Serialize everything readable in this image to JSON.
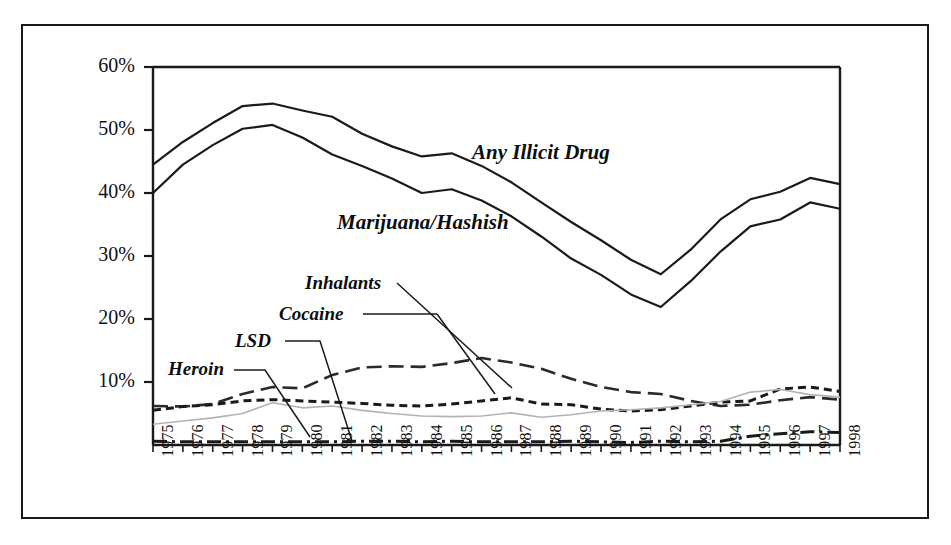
{
  "chart_data": {
    "type": "line",
    "title": "",
    "xlabel": "",
    "ylabel": "",
    "ylim": [
      0,
      60
    ],
    "xlim": [
      1975,
      1998
    ],
    "grid": false,
    "legend_position": "inline-annotations",
    "y_tick_labels": [
      "60%",
      "50%",
      "40%",
      "30%",
      "20%",
      "10%"
    ],
    "y_ticks": [
      60,
      50,
      40,
      30,
      20,
      10
    ],
    "categories": [
      "1975",
      "1976",
      "1977",
      "1978",
      "1979",
      "1980",
      "1981",
      "1982",
      "1983",
      "1984",
      "1985",
      "1986",
      "1987",
      "1988",
      "1989",
      "1990",
      "1991",
      "1992",
      "1993",
      "1994",
      "1995",
      "1996",
      "1997",
      "1998"
    ],
    "series": [
      {
        "name": "Any Illicit Drug",
        "style": "solid",
        "color": "#1a1a1a",
        "values": [
          44.5,
          48.1,
          51.1,
          53.8,
          54.2,
          53.1,
          52.1,
          49.4,
          47.4,
          45.8,
          46.3,
          44.3,
          41.7,
          38.5,
          35.4,
          32.5,
          29.4,
          27.1,
          31.0,
          35.8,
          39.0,
          40.2,
          42.4,
          41.4
        ],
        "label_position": {
          "x": 472,
          "y": 152
        }
      },
      {
        "name": "Marijuana/Hashish",
        "style": "solid",
        "color": "#1a1a1a",
        "values": [
          40.0,
          44.5,
          47.6,
          50.2,
          50.8,
          48.8,
          46.1,
          44.3,
          42.3,
          40.0,
          40.6,
          38.8,
          36.3,
          33.1,
          29.6,
          27.0,
          23.9,
          21.9,
          26.0,
          30.7,
          34.7,
          35.8,
          38.5,
          37.5
        ],
        "label_position": {
          "x": 337,
          "y": 221
        }
      },
      {
        "name": "Inhalants",
        "style": "long-dash",
        "color": "#2a2a2a",
        "values": [
          6.2,
          6.1,
          6.5,
          8.1,
          9.2,
          9.0,
          11.1,
          12.3,
          12.5,
          12.4,
          13.0,
          13.8,
          13.1,
          12.1,
          10.5,
          9.2,
          8.4,
          8.1,
          7.0,
          6.2,
          6.4,
          7.1,
          7.6,
          7.2
        ],
        "label_text": "Inhalants",
        "label_position": {
          "x": 305,
          "y": 272
        }
      },
      {
        "name": "Cocaine",
        "style": "short-dash",
        "color": "#1a1a1a",
        "values": [
          5.5,
          6.1,
          6.4,
          7.0,
          7.2,
          7.0,
          6.8,
          6.6,
          6.3,
          6.2,
          6.5,
          7.0,
          7.5,
          6.5,
          6.4,
          5.7,
          5.4,
          5.6,
          6.2,
          6.8,
          7.0,
          8.9,
          9.2,
          8.5
        ],
        "label_text": "Cocaine",
        "label_position": {
          "x": 279,
          "y": 303
        }
      },
      {
        "name": "LSD",
        "style": "solid-thin",
        "color": "#b3b3b3",
        "values": [
          3.3,
          3.8,
          4.3,
          5.0,
          6.7,
          5.9,
          6.2,
          5.5,
          5.0,
          4.6,
          4.5,
          4.6,
          5.1,
          4.4,
          4.8,
          5.4,
          5.6,
          5.9,
          6.4,
          6.9,
          8.4,
          8.8,
          8.0,
          7.6
        ],
        "label_text": "LSD",
        "label_position": {
          "x": 235,
          "y": 330
        }
      },
      {
        "name": "Heroin",
        "style": "dash-dot",
        "color": "#1a1a1a",
        "values": [
          0.6,
          0.5,
          0.5,
          0.5,
          0.5,
          0.5,
          0.5,
          0.6,
          0.6,
          0.5,
          0.6,
          0.5,
          0.5,
          0.5,
          0.6,
          0.5,
          0.4,
          0.6,
          0.5,
          0.6,
          1.4,
          1.8,
          2.1,
          2.0
        ],
        "label_text": "Heroin",
        "label_position": {
          "x": 168,
          "y": 358
        }
      }
    ]
  },
  "axis": {
    "y_labels": [
      "60%",
      "50%",
      "40%",
      "30%",
      "20%",
      "10%"
    ],
    "x_labels": [
      "1975",
      "1976",
      "1977",
      "1978",
      "1979",
      "1980",
      "1981",
      "1982",
      "1983",
      "1984",
      "1985",
      "1986",
      "1987",
      "1988",
      "1989",
      "1990",
      "1991",
      "1992",
      "1993",
      "1994",
      "1995",
      "1996",
      "1997",
      "1998"
    ]
  },
  "annotations": {
    "any_illicit_drug": "Any Illicit Drug",
    "marijuana_hashish": "Marijuana/Hashish",
    "inhalants": "Inhalants",
    "cocaine": "Cocaine",
    "lsd": "LSD",
    "heroin": "Heroin"
  },
  "colors": {
    "frame": "#1a1a1a",
    "ink": "#1a1a1a",
    "lsd_line": "#b3b3b3",
    "background": "#ffffff"
  }
}
